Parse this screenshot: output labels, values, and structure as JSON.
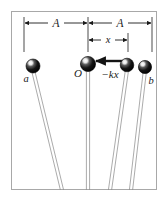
{
  "figure": {
    "frame": {
      "stroke_color": "#a8a8a8",
      "fill_color": "#ffffff",
      "x": 11,
      "y": 11,
      "width": 146,
      "height": 179
    },
    "labels": {
      "amplitude_left": "A",
      "amplitude_right": "A",
      "displacement": "x",
      "origin": "O",
      "force": "−kx",
      "bob_left": "a",
      "bob_right": "b"
    },
    "bobs": [
      {
        "name": "bob-a",
        "label": "a",
        "cx": 33,
        "cy": 66,
        "r": 7.0
      },
      {
        "name": "bob-o",
        "label": "O",
        "cx": 88,
        "cy": 64,
        "r": 7.6
      },
      {
        "name": "bob-x",
        "label": "",
        "cx": 127,
        "cy": 65,
        "r": 6.8
      },
      {
        "name": "bob-b",
        "label": "b",
        "cx": 145,
        "cy": 67,
        "r": 6.6
      }
    ],
    "strings": [
      {
        "name": "string-a",
        "x_top": 33,
        "y_top": 70,
        "x_bottom": 62,
        "y_bottom": 190
      },
      {
        "name": "string-o",
        "x_top": 88,
        "y_top": 70,
        "x_bottom": 88,
        "y_bottom": 190
      },
      {
        "name": "string-x",
        "x_top": 127,
        "y_top": 70,
        "x_bottom": 110,
        "y_bottom": 190
      },
      {
        "name": "string-b",
        "x_top": 145,
        "y_top": 70,
        "x_bottom": 131,
        "y_bottom": 190
      }
    ],
    "dimensions": {
      "amplitude_line_y": 23,
      "displacement_line_y": 40,
      "left_tick_x": 24,
      "center_tick_x": 88,
      "right_tick_x": 152,
      "displacement_right_x": 128,
      "extension_top_y": 17,
      "extension_bottom_y": 52
    },
    "force_arrow": {
      "name": "force-arrow",
      "from_x": 123,
      "from_y": 61,
      "to_x": 95,
      "to_y": 61
    },
    "colors": {
      "ink": "#1a1a1a",
      "frame": "#a8a8a8",
      "string": "#8c8c8c",
      "bob_fill": "#111111",
      "bob_highlight": "#ffffff"
    }
  }
}
